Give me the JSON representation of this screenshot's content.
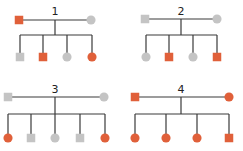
{
  "colors": {
    "affected": "#e0603a",
    "unaffected": "#c4c4c4",
    "line": "#3a3a3a"
  },
  "legend_semantics": {
    "square": "male",
    "circle": "female",
    "orange": "affected",
    "gray": "unaffected"
  },
  "pedigrees": [
    {
      "label": "1",
      "parents": [
        {
          "sex": "male",
          "status": "affected"
        },
        {
          "sex": "female",
          "status": "unaffected"
        }
      ],
      "children": [
        {
          "sex": "male",
          "status": "unaffected"
        },
        {
          "sex": "male",
          "status": "affected"
        },
        {
          "sex": "female",
          "status": "unaffected"
        },
        {
          "sex": "female",
          "status": "affected"
        }
      ]
    },
    {
      "label": "2",
      "parents": [
        {
          "sex": "male",
          "status": "unaffected"
        },
        {
          "sex": "female",
          "status": "unaffected"
        }
      ],
      "children": [
        {
          "sex": "female",
          "status": "unaffected"
        },
        {
          "sex": "male",
          "status": "affected"
        },
        {
          "sex": "female",
          "status": "unaffected"
        },
        {
          "sex": "male",
          "status": "affected"
        }
      ]
    },
    {
      "label": "3",
      "parents": [
        {
          "sex": "male",
          "status": "unaffected"
        },
        {
          "sex": "female",
          "status": "unaffected"
        }
      ],
      "children": [
        {
          "sex": "female",
          "status": "affected"
        },
        {
          "sex": "male",
          "status": "unaffected"
        },
        {
          "sex": "female",
          "status": "unaffected"
        },
        {
          "sex": "male",
          "status": "unaffected"
        },
        {
          "sex": "female",
          "status": "affected"
        }
      ]
    },
    {
      "label": "4",
      "parents": [
        {
          "sex": "male",
          "status": "affected"
        },
        {
          "sex": "female",
          "status": "affected"
        }
      ],
      "children": [
        {
          "sex": "female",
          "status": "affected"
        },
        {
          "sex": "female",
          "status": "affected"
        },
        {
          "sex": "female",
          "status": "affected"
        },
        {
          "sex": "male",
          "status": "affected"
        }
      ]
    }
  ]
}
